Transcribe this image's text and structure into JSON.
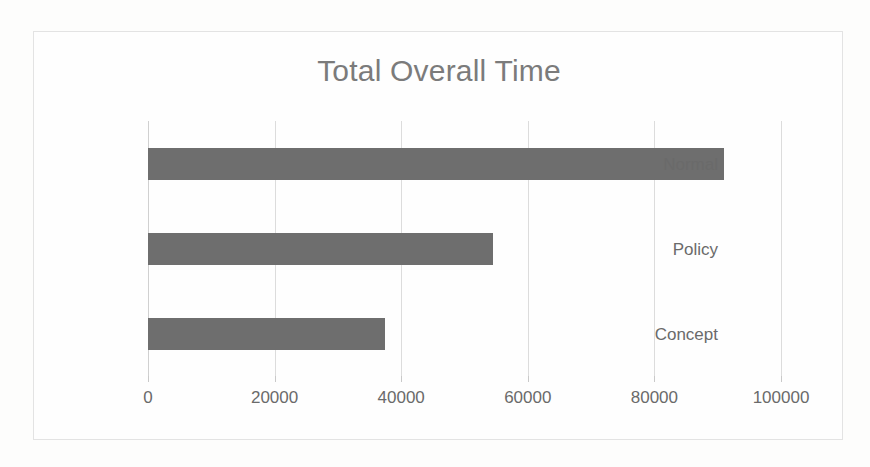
{
  "chart_data": {
    "type": "bar",
    "orientation": "horizontal",
    "title": "Total Overall Time",
    "xlabel": "",
    "ylabel": "",
    "categories": [
      "Normal",
      "Policy",
      "Concept"
    ],
    "values": [
      91000,
      54500,
      37500
    ],
    "series": [
      {
        "name": "Total Overall Time",
        "values": [
          91000,
          54500,
          37500
        ]
      }
    ],
    "xlim": [
      0,
      100000
    ],
    "xticks": [
      0,
      20000,
      40000,
      60000,
      80000,
      100000
    ],
    "xtick_labels": [
      "0",
      "20000",
      "40000",
      "60000",
      "80000",
      "100000"
    ],
    "grid": true,
    "grid_axis": "x",
    "legend": false,
    "legend_position": "none",
    "bar_color": "#6e6e6e",
    "title_color": "#7b7b7b",
    "axis_label_color": "#6a6a6a",
    "gridline_color": "#dcdcdc",
    "frame_color": "#e3e3e3",
    "background_color": "#fefefe"
  }
}
